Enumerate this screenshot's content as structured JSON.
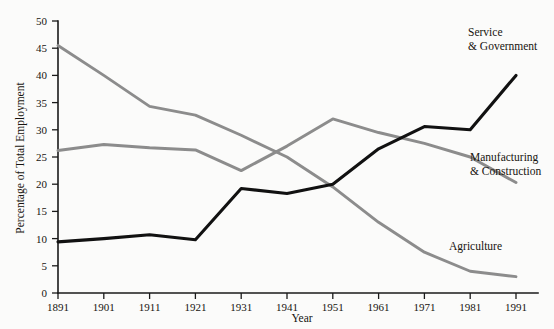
{
  "chart_data": {
    "type": "line",
    "title": "",
    "subtitle": "",
    "xlabel": "Year",
    "ylabel": "Percentage of Total Employment",
    "x": [
      1891,
      1901,
      1911,
      1921,
      1931,
      1941,
      1951,
      1961,
      1971,
      1981,
      1991
    ],
    "xticklabels": [
      "1891",
      "1901",
      "1911",
      "1921",
      "1931",
      "1941",
      "1951",
      "1961",
      "1971",
      "1981",
      "1991"
    ],
    "yticklabels": [
      "0",
      "5",
      "10",
      "15",
      "20",
      "25",
      "30",
      "35",
      "40",
      "45",
      "50"
    ],
    "ytickvalues": [
      0,
      5,
      10,
      15,
      20,
      25,
      30,
      35,
      40,
      45,
      50
    ],
    "xlim": [
      1891,
      1991
    ],
    "ylim": [
      0,
      50
    ],
    "grid": false,
    "legend_position": "inline-right",
    "series": [
      {
        "name": "Agriculture",
        "label": "Agriculture",
        "color": "#8c8c8c",
        "values": [
          45.5,
          40.0,
          34.3,
          32.7,
          29.0,
          25.0,
          19.5,
          13.0,
          7.5,
          4.0,
          3.0
        ]
      },
      {
        "name": "Manufacturing & Construction",
        "label_line1": "Manufacturing",
        "label_line2": "& Construction",
        "color": "#8c8c8c",
        "values": [
          26.2,
          27.3,
          26.7,
          26.3,
          22.5,
          27.0,
          32.0,
          29.5,
          27.5,
          25.0,
          20.3
        ]
      },
      {
        "name": "Service & Government",
        "label_line1": "Service",
        "label_line2": "& Government",
        "color": "#111111",
        "values": [
          9.4,
          10.0,
          10.7,
          9.8,
          19.2,
          18.3,
          20.0,
          26.5,
          30.6,
          30.0,
          40.0
        ]
      }
    ]
  },
  "labels": {
    "service_line1": "Service",
    "service_line2": "& Government",
    "manufacturing_line1": "Manufacturing",
    "manufacturing_line2": "& Construction",
    "agriculture": "Agriculture",
    "xaxis_title": "Year",
    "yaxis_title": "Percentage of Total Employment"
  }
}
